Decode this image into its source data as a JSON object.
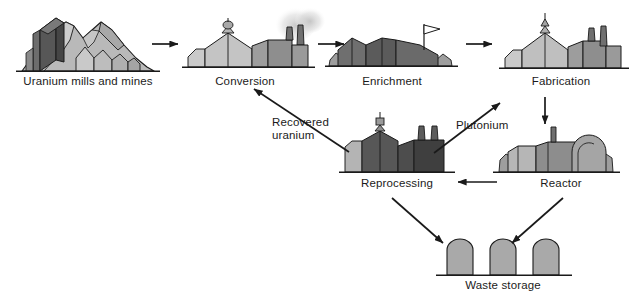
{
  "diagram": {
    "background": "#ffffff",
    "stroke": "#1a1a1a",
    "palette": {
      "light_gray": "#cfcfcf",
      "mid_gray": "#9a9a9a",
      "dark_gray": "#585858",
      "darker_gray": "#4a4a4a",
      "ground": "#8f8f8f",
      "smoke": "#d8d8d8",
      "outline": "#1a1a1a"
    },
    "nodes": [
      {
        "id": "mills",
        "label": "Uranium mills and mines",
        "x": 88,
        "y": 84,
        "icon": "mountain-mine-icon"
      },
      {
        "id": "conversion",
        "label": "Conversion",
        "x": 245,
        "y": 84,
        "icon": "conversion-plant-icon"
      },
      {
        "id": "enrichment",
        "label": "Enrichment",
        "x": 392,
        "y": 84,
        "icon": "enrichment-plant-icon"
      },
      {
        "id": "fabrication",
        "label": "Fabrication",
        "x": 561,
        "y": 84,
        "icon": "fabrication-plant-icon"
      },
      {
        "id": "reprocessing",
        "label": "Reprocessing",
        "x": 397,
        "y": 188,
        "icon": "reprocessing-plant-icon"
      },
      {
        "id": "reactor",
        "label": "Reactor",
        "x": 561,
        "y": 188,
        "icon": "reactor-icon"
      },
      {
        "id": "waste",
        "label": "Waste storage",
        "x": 516,
        "y": 289,
        "icon": "waste-silos-icon"
      }
    ],
    "edge_labels": [
      {
        "id": "recovered-uranium",
        "text": "Recovered\nuranium",
        "line1": "Recovered",
        "line2": "uranium",
        "x": 272,
        "y": 118
      },
      {
        "id": "plutonium",
        "text": "Plutonium",
        "line1": "Plutonium",
        "line2": "",
        "x": 456,
        "y": 120
      }
    ],
    "edges": [
      {
        "id": "mills-to-conversion",
        "from": "mills",
        "to": "conversion",
        "kind": "arrow-right"
      },
      {
        "id": "conversion-to-enrichment",
        "from": "conversion",
        "to": "enrichment",
        "kind": "arrow-right"
      },
      {
        "id": "enrichment-to-fabrication",
        "from": "enrichment",
        "to": "fabrication",
        "kind": "arrow-right"
      },
      {
        "id": "fabrication-to-reactor",
        "from": "fabrication",
        "to": "reactor",
        "kind": "arrow-down"
      },
      {
        "id": "reactor-to-reprocessing",
        "from": "reactor",
        "to": "reprocessing",
        "kind": "arrow-left"
      },
      {
        "id": "reprocessing-to-conversion",
        "from": "reprocessing",
        "to": "conversion",
        "kind": "arrow-diagonal-up-left",
        "label": "recovered-uranium"
      },
      {
        "id": "reprocessing-to-fabrication",
        "from": "reprocessing",
        "to": "fabrication",
        "kind": "arrow-diagonal-up-right",
        "label": "plutonium"
      },
      {
        "id": "reprocessing-to-waste",
        "from": "reprocessing",
        "to": "waste",
        "kind": "arrow-diagonal-down-right"
      },
      {
        "id": "reactor-to-waste",
        "from": "reactor",
        "to": "waste",
        "kind": "arrow-diagonal-down-left"
      }
    ]
  }
}
